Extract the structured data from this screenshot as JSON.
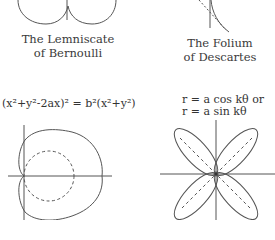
{
  "figures": [
    {
      "id": "lemniscate",
      "caption_line1": "The Lemniscate",
      "caption_line2": "of Bernoulli"
    },
    {
      "id": "folium",
      "caption_line1": "The Folium",
      "caption_line2": "of Descartes"
    },
    {
      "id": "limacon",
      "equation": "(x²+y²-2ax)² = b²(x²+y²)"
    },
    {
      "id": "rose",
      "equation_line1": "r = a cos kθ  or",
      "equation_line2": "r = a  sin kθ"
    }
  ],
  "colors": {
    "stroke": "#555555",
    "text": "#333333",
    "background": "#ffffff"
  }
}
